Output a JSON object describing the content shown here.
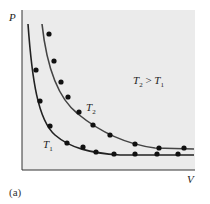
{
  "chart_data": {
    "type": "line",
    "title": "",
    "xlabel": "V",
    "ylabel": "P",
    "grid": false,
    "annotation": "T2 > T1",
    "panel_label": "(a)",
    "series": [
      {
        "name": "T1",
        "curve": "isotherm P = k1/V (lower)",
        "points_px": [
          [
            30,
            20
          ],
          [
            36,
            70
          ],
          [
            40,
            101
          ],
          [
            50,
            126
          ],
          [
            67,
            143
          ],
          [
            83,
            147
          ],
          [
            96,
            152
          ],
          [
            114,
            154
          ],
          [
            135,
            154
          ],
          [
            157,
            154
          ],
          [
            178,
            154
          ]
        ]
      },
      {
        "name": "T2",
        "curve": "isotherm P = k2/V (upper)",
        "points_px": [
          [
            49,
            34
          ],
          [
            54,
            61
          ],
          [
            61,
            82
          ],
          [
            68,
            97
          ],
          [
            79,
            112
          ],
          [
            93,
            125
          ],
          [
            110,
            135
          ],
          [
            135,
            144
          ],
          [
            159,
            148
          ],
          [
            184,
            148
          ]
        ]
      }
    ],
    "colors": {
      "background": "#ebebeb",
      "curves": "#222222",
      "dots": "#111111"
    }
  },
  "labels": {
    "y_axis": "P",
    "x_axis": "V",
    "t1": "T",
    "t1_sub": "1",
    "t2": "T",
    "t2_sub": "2",
    "relation_a": "T",
    "relation_a_sub": "2",
    "relation_op": " > ",
    "relation_b": "T",
    "relation_b_sub": "1",
    "caption": "(a)"
  }
}
